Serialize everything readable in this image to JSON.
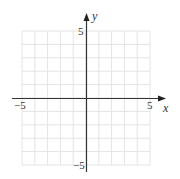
{
  "diagram": {
    "type": "coordinate-grid",
    "x_axis": {
      "label": "x",
      "min": -5,
      "max": 5,
      "tick_labels": [
        "−5",
        "5"
      ]
    },
    "y_axis": {
      "label": "y",
      "min": -5,
      "max": 5,
      "tick_labels": [
        "5",
        "−5"
      ]
    },
    "grid": {
      "cells_x": 10,
      "cells_y": 10,
      "color": "#e4e4e4"
    },
    "axis_color": "#333333"
  }
}
